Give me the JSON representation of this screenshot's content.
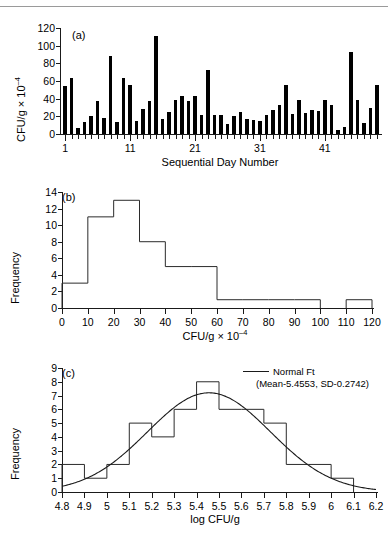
{
  "figure": {
    "panels": [
      "(a)",
      "(b)",
      "(c)"
    ]
  },
  "panel_a": {
    "tag": "(a)",
    "ylabel": "CFU/g × 10",
    "ylabel_exponent": "–4",
    "xlabel": "Sequential Day Number",
    "yticks": [
      "0",
      "20",
      "40",
      "60",
      "80",
      "100",
      "120"
    ],
    "xticks": [
      "1",
      "11",
      "21",
      "31",
      "41"
    ]
  },
  "panel_b": {
    "tag": "(b)",
    "ylabel": "Frequency",
    "xlabel": "CFU/g × 10",
    "xlabel_exponent": "–4",
    "yticks": [
      "0",
      "2",
      "4",
      "6",
      "8",
      "10",
      "12",
      "14"
    ],
    "xticks": [
      "0",
      "10",
      "20",
      "30",
      "40",
      "50",
      "60",
      "70",
      "80",
      "90",
      "100",
      "110",
      "120"
    ]
  },
  "panel_c": {
    "tag": "(c)",
    "ylabel": "Frequency",
    "xlabel": "log CFU/g",
    "yticks": [
      "0",
      "1",
      "2",
      "3",
      "4",
      "5",
      "6",
      "7",
      "8",
      "9"
    ],
    "xticks": [
      "4.8",
      "4.9",
      "5",
      "5.1",
      "5.2",
      "5.3",
      "5.4",
      "5.5",
      "5.6",
      "5.7",
      "5.8",
      "5.9",
      "6",
      "6.1",
      "6.2"
    ],
    "legend_label": "Normal Ft",
    "legend_params": "(Mean-5.4553, SD-0.2742)"
  },
  "chart_data": [
    {
      "type": "bar",
      "panel": "(a)",
      "title": "",
      "xlabel": "Sequential Day Number",
      "ylabel": "CFU/g × 10⁻⁴",
      "xlim": [
        0.5,
        49.5
      ],
      "ylim": [
        0,
        120
      ],
      "yticks": [
        0,
        20,
        40,
        60,
        80,
        100,
        120
      ],
      "xticks": [
        1,
        11,
        21,
        31,
        41
      ],
      "grid": false,
      "bar_color": "#000000",
      "categories": [
        1,
        2,
        3,
        4,
        5,
        6,
        7,
        8,
        9,
        10,
        11,
        12,
        13,
        14,
        15,
        16,
        17,
        18,
        19,
        20,
        21,
        22,
        23,
        24,
        25,
        26,
        27,
        28,
        29,
        30,
        31,
        32,
        33,
        34,
        35,
        36,
        37,
        38,
        39,
        40,
        41,
        42,
        43,
        44,
        45,
        46,
        47,
        48,
        49
      ],
      "values": [
        54,
        63,
        7,
        14,
        20,
        37,
        18,
        88,
        14,
        63,
        55,
        15,
        28,
        37,
        111,
        17,
        25,
        38,
        43,
        37,
        43,
        21,
        72,
        22,
        22,
        11,
        20,
        25,
        17,
        16,
        15,
        21,
        27,
        33,
        56,
        23,
        38,
        24,
        27,
        26,
        38,
        33,
        4,
        8,
        93,
        39,
        12,
        29,
        55
      ]
    },
    {
      "type": "bar",
      "panel": "(b)",
      "title": "",
      "xlabel": "CFU/g × 10⁻⁴",
      "ylabel": "Frequency",
      "xlim": [
        0,
        120
      ],
      "ylim": [
        0,
        14
      ],
      "yticks": [
        0,
        2,
        4,
        6,
        8,
        10,
        12,
        14
      ],
      "xticks": [
        0,
        10,
        20,
        30,
        40,
        50,
        60,
        70,
        80,
        90,
        100,
        110,
        120
      ],
      "grid": false,
      "bin_edges": [
        0,
        10,
        20,
        30,
        40,
        50,
        60,
        70,
        80,
        90,
        100,
        110,
        120
      ],
      "categories": [
        "0-10",
        "10-20",
        "20-30",
        "30-40",
        "40-50",
        "50-60",
        "60-70",
        "70-80",
        "80-90",
        "90-100",
        "100-110",
        "110-120"
      ],
      "values": [
        3,
        11,
        13,
        8,
        5,
        5,
        1,
        1,
        1,
        1,
        0,
        1
      ]
    },
    {
      "type": "bar",
      "panel": "(c)",
      "title": "",
      "xlabel": "log CFU/g",
      "ylabel": "Frequency",
      "xlim": [
        4.8,
        6.2
      ],
      "ylim": [
        0,
        9
      ],
      "yticks": [
        0,
        1,
        2,
        3,
        4,
        5,
        6,
        7,
        8,
        9
      ],
      "xticks": [
        4.8,
        4.9,
        5.0,
        5.1,
        5.2,
        5.3,
        5.4,
        5.5,
        5.6,
        5.7,
        5.8,
        5.9,
        6.0,
        6.1,
        6.2
      ],
      "grid": false,
      "bin_edges": [
        4.8,
        4.9,
        5.0,
        5.1,
        5.2,
        5.3,
        5.4,
        5.5,
        5.6,
        5.7,
        5.8,
        5.9,
        6.0,
        6.1,
        6.2
      ],
      "categories": [
        "4.8-4.9",
        "4.9-5.0",
        "5.0-5.1",
        "5.1-5.2",
        "5.2-5.3",
        "5.3-5.4",
        "5.4-5.5",
        "5.5-5.6",
        "5.6-5.7",
        "5.7-5.8",
        "5.8-5.9",
        "5.9-6.0",
        "6.0-6.1",
        "6.1-6.2"
      ],
      "values": [
        2,
        1,
        2,
        5,
        4,
        6,
        8,
        6,
        6,
        5,
        2,
        2,
        1,
        0
      ],
      "series": [
        {
          "name": "Normal Ft",
          "type": "line",
          "mean": 5.4553,
          "sd": 0.2742,
          "peak": 7.2
        }
      ],
      "legend": [
        "Normal Ft",
        "(Mean-5.4553, SD-0.2742)"
      ],
      "legend_position": "top-right"
    }
  ]
}
